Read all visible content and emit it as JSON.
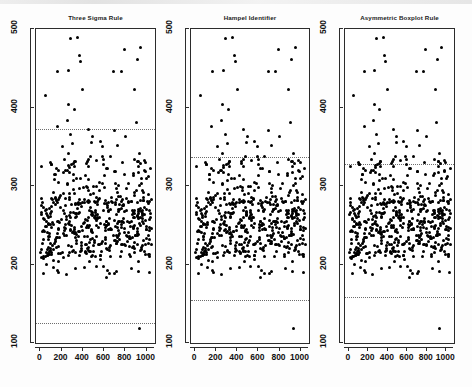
{
  "figure": {
    "panel_count": 3,
    "background_color": "#ffffff",
    "point_color": "#000000",
    "threshold_line_color": "#6e6e6e",
    "axis_color": "#2b2b2b"
  },
  "chart_data": [
    {
      "type": "scatter",
      "title": "Three Sigma Rule",
      "xlabel": "",
      "ylabel": "",
      "xlim": [
        -40,
        1080
      ],
      "ylim": [
        100,
        500
      ],
      "xticks": [
        0,
        200,
        400,
        600,
        800,
        1000
      ],
      "yticks": [
        100,
        200,
        300,
        400,
        500
      ],
      "grid": false,
      "legend": "none",
      "annotations": [
        {
          "kind": "threshold-line",
          "name": "upper-limit",
          "y": 372,
          "style": "dotted"
        },
        {
          "kind": "threshold-line",
          "name": "lower-limit",
          "y": 126,
          "style": "dotted"
        }
      ],
      "x": [
        12,
        18,
        25,
        31,
        38,
        44,
        52,
        58,
        65,
        72,
        79,
        86,
        92,
        99,
        106,
        113,
        120,
        127,
        134,
        141,
        148,
        155,
        162,
        169,
        176,
        183,
        190,
        197,
        204,
        211,
        218,
        225,
        232,
        239,
        246,
        253,
        260,
        267,
        274,
        281,
        288,
        295,
        302,
        309,
        316,
        323,
        330,
        337,
        344,
        351,
        358,
        365,
        372,
        379,
        386,
        393,
        400,
        407,
        414,
        421,
        428,
        435,
        442,
        449,
        456,
        463,
        470,
        477,
        484,
        491,
        498,
        505,
        512,
        519,
        526,
        533,
        540,
        547,
        554,
        561,
        568,
        575,
        582,
        589,
        596,
        603,
        610,
        617,
        624,
        631,
        638,
        645,
        652,
        659,
        666,
        673,
        680,
        687,
        694,
        701,
        708,
        715,
        722,
        729,
        736,
        743,
        750,
        757,
        764,
        771,
        778,
        785,
        792,
        799,
        806,
        813,
        820,
        827,
        834,
        841,
        848,
        855,
        862,
        869,
        876,
        883,
        890,
        897,
        904,
        911,
        918,
        925,
        932,
        939,
        946,
        953,
        960,
        967,
        974,
        981,
        988,
        995,
        1002,
        1009,
        1016,
        1023,
        1030,
        1037,
        1044,
        16,
        42,
        68,
        94,
        120,
        146,
        172,
        198,
        224,
        250,
        276,
        302,
        328,
        354,
        380,
        406,
        432,
        458,
        484,
        510,
        536,
        562,
        588,
        614,
        640,
        666,
        692,
        718,
        744,
        770,
        796,
        822,
        848,
        874,
        900,
        926,
        952,
        978,
        1004,
        1030,
        30,
        60,
        90,
        120,
        150,
        180,
        210,
        240,
        270,
        300,
        330,
        360,
        390,
        420,
        450,
        480,
        510,
        540,
        570,
        600,
        630,
        660,
        690,
        720,
        750,
        780,
        810,
        840,
        870,
        900,
        930,
        960,
        990,
        1020,
        1050,
        22,
        55,
        88,
        121,
        154,
        187,
        220,
        253,
        286,
        319,
        352,
        385,
        418,
        451,
        484,
        517,
        550,
        583,
        616,
        649,
        682,
        715,
        748,
        781,
        814,
        847,
        880,
        913,
        946,
        979,
        1012,
        1045,
        37,
        74,
        111,
        148,
        185,
        222,
        259,
        296,
        333,
        370,
        407,
        444,
        481,
        518,
        555,
        592,
        629,
        666,
        703,
        740,
        777,
        814,
        851,
        888,
        925,
        962,
        999,
        1036,
        50,
        100,
        150,
        200,
        250,
        300,
        350,
        400,
        450,
        500,
        550,
        600,
        650,
        700,
        750,
        800,
        850,
        900,
        950,
        1000,
        1050,
        27,
        81,
        135,
        189,
        243,
        297,
        351,
        405,
        459,
        513,
        567,
        621,
        675,
        729,
        783,
        837,
        891,
        945,
        999,
        1053,
        45,
        135,
        225,
        315,
        405,
        495,
        585,
        675,
        765,
        855,
        945,
        1035,
        70,
        140,
        210,
        280,
        350,
        420,
        490,
        560,
        630,
        700,
        770,
        840,
        910,
        980,
        1050,
        33,
        99,
        165,
        231,
        297,
        363,
        429,
        495,
        561,
        627,
        693,
        759,
        825,
        891,
        957,
        1023,
        60,
        180,
        300,
        420,
        540,
        660,
        780,
        900,
        1020,
        110,
        330,
        550,
        770,
        990,
        200,
        600,
        1000,
        375,
        760,
        290,
        880,
        430,
        150,
        640,
        920,
        255,
        515,
        845,
        205,
        665,
        985,
        145,
        495,
        715,
        945,
        85,
        365,
        625,
        805,
        1025,
        175,
        455,
        735,
        315,
        595,
        875,
        240,
        520,
        800,
        390,
        670,
        950,
        130,
        410,
        690,
        970,
        225,
        505,
        785,
        345,
        625,
        905,
        165,
        445,
        725,
        1005,
        285,
        565,
        845,
        95,
        465,
        835,
        275,
        755,
        615,
        195,
        935,
        355,
        95,
        475,
        855,
        235,
        695,
        575,
        155,
        895,
        315,
        435,
        815,
        195,
        655,
        535,
        115,
        1035,
        275,
        395,
        775,
        255,
        615,
        495,
        75,
        995,
        235,
        355,
        735,
        215,
        575,
        455,
        1015,
        335,
        715,
        195,
        555,
        435,
        995,
        315,
        695,
        175,
        535,
        415,
        975,
        295,
        675,
        155,
        515,
        395,
        955,
        335
      ],
      "y": [
        236,
        241,
        255,
        228,
        263,
        219,
        248,
        234,
        271,
        225,
        242,
        257,
        230,
        268,
        222,
        249,
        239,
        277,
        215,
        253,
        231,
        262,
        244,
        226,
        259,
        238,
        285,
        221,
        246,
        233,
        267,
        229,
        251,
        274,
        218,
        243,
        258,
        235,
        264,
        223,
        247,
        237,
        280,
        217,
        252,
        232,
        266,
        227,
        250,
        273,
        216,
        245,
        256,
        234,
        261,
        224,
        254,
        240,
        269,
        220,
        244,
        260,
        231,
        276,
        214,
        248,
        238,
        265,
        229,
        253,
        235,
        272,
        219,
        246,
        257,
        233,
        263,
        222,
        251,
        241,
        278,
        217,
        247,
        236,
        268,
        226,
        255,
        232,
        270,
        223,
        249,
        239,
        259,
        230,
        266,
        218,
        252,
        243,
        275,
        215,
        250,
        237,
        261,
        228,
        254,
        240,
        279,
        221,
        248,
        234,
        264,
        227,
        256,
        231,
        269,
        224,
        245,
        258,
        233,
        262,
        219,
        253,
        242,
        274,
        216,
        249,
        236,
        265,
        230,
        251,
        238,
        271,
        222,
        247,
        257,
        234,
        260,
        225,
        255,
        232,
        267,
        220,
        244,
        259,
        235,
        276,
        214,
        250,
        241,
        263,
        229,
        253,
        333,
        312,
        345,
        298,
        327,
        356,
        305,
        319,
        341,
        292,
        350,
        308,
        336,
        323,
        358,
        301,
        330,
        315,
        347,
        295,
        338,
        310,
        352,
        325,
        303,
        342,
        318,
        296,
        355,
        307,
        331,
        344,
        299,
        322,
        349,
        311,
        334,
        297,
        353,
        316,
        202,
        189,
        211,
        196,
        207,
        183,
        215,
        193,
        205,
        198,
        186,
        213,
        201,
        191,
        209,
        195,
        204,
        187,
        212,
        199,
        190,
        208,
        197,
        214,
        185,
        203,
        206,
        192,
        210,
        200,
        188,
        216,
        194,
        209,
        196,
        254,
        239,
        267,
        233,
        248,
        261,
        227,
        256,
        243,
        270,
        221,
        250,
        236,
        264,
        230,
        259,
        241,
        275,
        218,
        247,
        257,
        234,
        266,
        225,
        252,
        238,
        272,
        215,
        245,
        260,
        232,
        268,
        281,
        295,
        275,
        288,
        302,
        279,
        292,
        309,
        284,
        298,
        276,
        305,
        287,
        300,
        283,
        293,
        307,
        278,
        296,
        285,
        303,
        274,
        290,
        282,
        299,
        286,
        294,
        264,
        240,
        253,
        228,
        246,
        259,
        235,
        251,
        238,
        267,
        224,
        249,
        256,
        232,
        261,
        229,
        244,
        272,
        220,
        247,
        255,
        230,
        243,
        266,
        225,
        252,
        237,
        260,
        222,
        248,
        258,
        233,
        269,
        226,
        241,
        263,
        231,
        245,
        271,
        223,
        254,
        239,
        265,
        228,
        250,
        236,
        262,
        227,
        256,
        242,
        268,
        221,
        249,
        234,
        259,
        231,
        246,
        260,
        237,
        253,
        240,
        330,
        318,
        304,
        340,
        311,
        326,
        298,
        348,
        192,
        179,
        201,
        168,
        186,
        362,
        352,
        375,
        420,
        377,
        417,
        395,
        403,
        455,
        385,
        408,
        339,
        343,
        332,
        429,
        372,
        366,
        325,
        350,
        335,
        360,
        345,
        170,
        175,
        182,
        173,
        177,
        190,
        181,
        184,
        165,
        195,
        172,
        178,
        186,
        169,
        191,
        205,
        203,
        208,
        199,
        214,
        206,
        211,
        200,
        217,
        209,
        202,
        220,
        215,
        204,
        212,
        218,
        207,
        198,
        210,
        216,
        213,
        197,
        219,
        208,
        201,
        223,
        212,
        205,
        194,
        196,
        218,
        207,
        215,
        203,
        210,
        206,
        189,
        214,
        199,
        217,
        195,
        208,
        211,
        202,
        193,
        220,
        205,
        197,
        212,
        187,
        216,
        200,
        119,
        209
      ]
    },
    {
      "type": "scatter",
      "title": "Hampel Identifier",
      "xlabel": "",
      "ylabel": "",
      "xlim": [
        -40,
        1080
      ],
      "ylim": [
        100,
        500
      ],
      "xticks": [
        0,
        200,
        400,
        600,
        800,
        1000
      ],
      "yticks": [
        100,
        200,
        300,
        400,
        500
      ],
      "grid": false,
      "legend": "none",
      "annotations": [
        {
          "kind": "threshold-line",
          "name": "upper-limit",
          "y": 337,
          "style": "dotted"
        },
        {
          "kind": "threshold-line",
          "name": "lower-limit",
          "y": 155,
          "style": "dotted"
        }
      ]
    },
    {
      "type": "scatter",
      "title": "Asymmetric Boxplot Rule",
      "xlabel": "",
      "ylabel": "",
      "xlim": [
        -40,
        1080
      ],
      "ylim": [
        100,
        500
      ],
      "xticks": [
        0,
        200,
        400,
        600,
        800,
        1000
      ],
      "yticks": [
        100,
        200,
        300,
        400,
        500
      ],
      "grid": false,
      "legend": "none",
      "annotations": [
        {
          "kind": "threshold-line",
          "name": "upper-limit",
          "y": 328,
          "style": "dotted"
        },
        {
          "kind": "threshold-line",
          "name": "lower-limit",
          "y": 158,
          "style": "dotted"
        }
      ]
    }
  ]
}
